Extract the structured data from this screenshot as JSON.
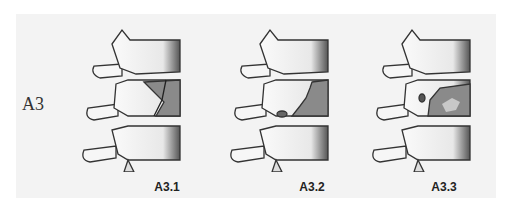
{
  "row_label": "A3",
  "figures": [
    {
      "caption": "A3.1",
      "fracture": "split-incomplete"
    },
    {
      "caption": "A3.2",
      "fracture": "split-posterior"
    },
    {
      "caption": "A3.3",
      "fracture": "burst-incomplete"
    }
  ],
  "colors": {
    "bone": "#f7f7f7",
    "outline": "#333333",
    "fracture": "#8a8a8a",
    "background": "#f3f3f3"
  }
}
